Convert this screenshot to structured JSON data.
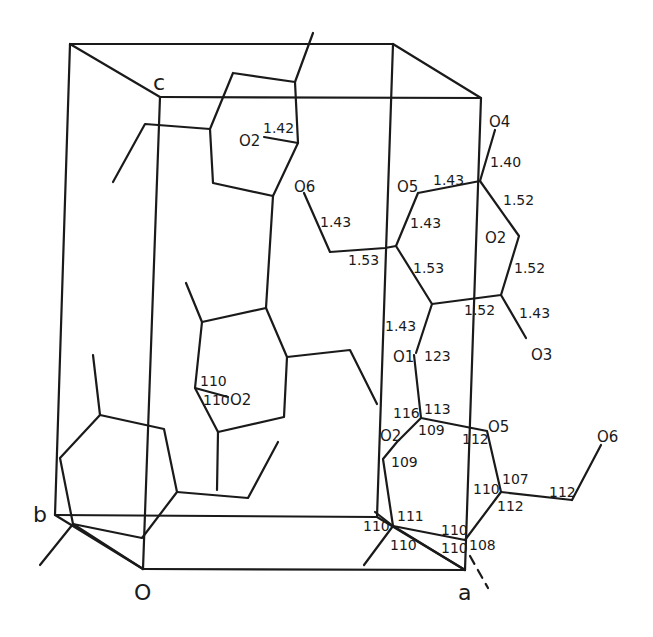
{
  "figure": {
    "stroke_color": "#1a1a1a",
    "background": "#ffffff"
  },
  "axes": {
    "origin": "O",
    "a": "a",
    "b": "b",
    "c": "c"
  },
  "atoms": {
    "upper_left_O2": "O2",
    "middle_O6": "O6",
    "right_O4": "O4",
    "right_O5": "O5",
    "right_ring_O2": "O2",
    "right_O3": "O3",
    "glycosidic_O1": "O1",
    "lower_O2": "O2",
    "lower_O5": "O5",
    "lower_O6": "O6",
    "middle_left_O2": "O2"
  },
  "bond_lengths": {
    "upper_left_C_O2": "1.42",
    "O4_C": "1.40",
    "O5_C_top": "1.43",
    "C_C_right_upper": "1.52",
    "O6_C": "1.43",
    "O5_C_left": "1.43",
    "C_C_ring_left": "1.53",
    "C6_C5": "1.53",
    "C_C_right_lower": "1.52",
    "C_C_bottom": "1.52",
    "C_O3": "1.43",
    "C1_O1": "1.43"
  },
  "bond_angles": {
    "O1_angle": "123",
    "C4_a": "116",
    "C4_b": "113",
    "C4_c": "109",
    "C3": "109",
    "O5_ring": "112",
    "C5_a": "107",
    "C5_b": "110",
    "C5_c": "112",
    "C6": "112",
    "C2_a": "111",
    "C2_b": "110",
    "C2_c": "110",
    "C1_a": "110",
    "C1_b": "110",
    "C1_c": "108",
    "middle_ring_a": "110",
    "middle_ring_b": "110"
  }
}
